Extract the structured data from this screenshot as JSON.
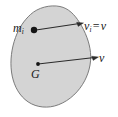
{
  "figure": {
    "kind": "mechanics-rigid-body-translation-diagram",
    "canvas": {
      "width": 118,
      "height": 117
    },
    "background_color": "#ffffff",
    "body": {
      "name": "rigid-body-blob",
      "fill_color": "#d4d4d4",
      "stroke_color": "#6e6e6e"
    },
    "labels": {
      "particle_mass": {
        "base": "m",
        "sub": "i"
      },
      "velocity_equation": {
        "base": "v",
        "sub": "i",
        "operator": "=",
        "rhs": "v"
      },
      "mass_center_velocity": "v",
      "mass_center": "G"
    },
    "points": [
      {
        "name": "particle-point",
        "label": "m_i",
        "x": 34,
        "y": 30,
        "marker": "filled-dot"
      },
      {
        "name": "mass-center-point",
        "label": "G",
        "x": 38,
        "y": 64,
        "marker": "filled-dot"
      }
    ],
    "vectors": [
      {
        "name": "particle-velocity-vector",
        "label": "v_i = v",
        "from": {
          "x": 36,
          "y": 30
        },
        "to": {
          "x": 84,
          "y": 23
        },
        "color": "#2b2b2b"
      },
      {
        "name": "mass-center-velocity-vector",
        "label": "v",
        "from": {
          "x": 38,
          "y": 64
        },
        "to": {
          "x": 99,
          "y": 57
        },
        "color": "#2b2b2b"
      }
    ]
  }
}
